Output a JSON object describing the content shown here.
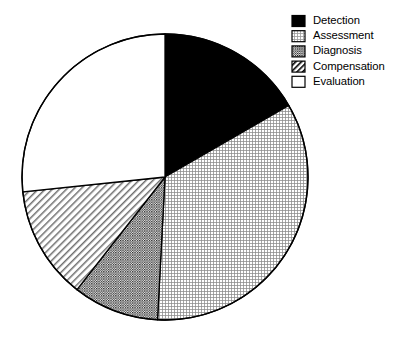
{
  "chart_data": {
    "type": "pie",
    "title": "",
    "subtitle": "",
    "xlabel": "",
    "ylabel": "",
    "grid": false,
    "legend_position": "top-right",
    "start_angle_deg": 0,
    "direction": "clockwise",
    "categories": [
      "Detection",
      "Assessment",
      "Diagnosis",
      "Compensation",
      "Evaluation"
    ],
    "values": [
      16.7,
      34.2,
      9.7,
      12.8,
      26.6
    ],
    "units": "percent",
    "slices": [
      {
        "label": "Detection",
        "value": 16.7,
        "start_deg": 0,
        "end_deg": 60,
        "fill_style": "solid-black",
        "fill_color": "#000000",
        "pattern": "none"
      },
      {
        "label": "Assessment",
        "value": 34.2,
        "start_deg": 60,
        "end_deg": 183,
        "fill_style": "light-stipple",
        "fill_color": "#ffffff",
        "pattern": "fine-grid-dots"
      },
      {
        "label": "Diagnosis",
        "value": 9.7,
        "start_deg": 183,
        "end_deg": 218,
        "fill_style": "dense-crosshatch",
        "fill_color": "#ffffff",
        "pattern": "dense-checker"
      },
      {
        "label": "Compensation",
        "value": 12.8,
        "start_deg": 218,
        "end_deg": 264,
        "fill_style": "diagonal-hatch",
        "fill_color": "#ffffff",
        "pattern": "diagonal-lines-45"
      },
      {
        "label": "Evaluation",
        "value": 26.6,
        "start_deg": 264,
        "end_deg": 360,
        "fill_style": "empty-white",
        "fill_color": "#ffffff",
        "pattern": "none"
      }
    ],
    "geometry": {
      "center_x": 165,
      "center_y": 177,
      "radius": 143
    },
    "stroke_color": "#000000",
    "background_color": "#ffffff"
  },
  "legend": {
    "items": [
      {
        "label": "Detection",
        "swatch": "solid-black-swatch"
      },
      {
        "label": "Assessment",
        "swatch": "light-stipple-swatch"
      },
      {
        "label": "Diagnosis",
        "swatch": "dense-crosshatch-swatch"
      },
      {
        "label": "Compensation",
        "swatch": "diagonal-hatch-swatch"
      },
      {
        "label": "Evaluation",
        "swatch": "empty-white-swatch"
      }
    ]
  }
}
